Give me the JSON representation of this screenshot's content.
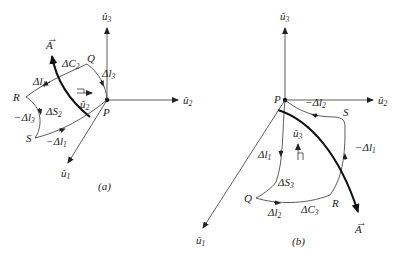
{
  "figure": {
    "panels": [
      {
        "id": "a",
        "caption": "(a)",
        "origin_label": "P",
        "axes": {
          "u1": "û1",
          "u2": "û2",
          "u3": "û3"
        },
        "vector_label": "A⃗",
        "curve_label": "ΔC2",
        "surface_label": "ΔS2",
        "normal_label": "û2",
        "corners": [
          "P",
          "Q",
          "R",
          "S"
        ],
        "segments": [
          "Δl⃗3",
          "Δl⃗1",
          "−Δl⃗3",
          "−Δl⃗1"
        ]
      },
      {
        "id": "b",
        "caption": "(b)",
        "origin_label": "P",
        "axes": {
          "u1": "û1",
          "u2": "û2",
          "u3": "û3"
        },
        "vector_label": "A⃗",
        "curve_label": "ΔC3",
        "surface_label": "ΔS3",
        "normal_label": "û3",
        "corners": [
          "P",
          "Q",
          "R",
          "S"
        ],
        "segments": [
          "Δl⃗1",
          "Δl⃗2",
          "−Δl⃗1",
          "−Δl⃗2"
        ]
      }
    ]
  },
  "labels": {
    "a": {
      "u3": "û",
      "u3s": "3",
      "u2": "û",
      "u2s": "2",
      "u1": "û",
      "u1s": "1",
      "A": "A",
      "Q": "Q",
      "R": "R",
      "S": "S",
      "P": "P",
      "dC": "ΔC",
      "dCs": "2",
      "dS": "ΔS",
      "dSs": "2",
      "dl3": "Δl",
      "dl3s": "3",
      "dl1": "Δl",
      "dl1s": "1",
      "mdl3": "−Δl",
      "mdl3s": "3",
      "mdl1": "−Δl",
      "mdl1s": "1",
      "n": "û",
      "ns": "2",
      "cap": "(a)"
    },
    "b": {
      "u3": "û",
      "u3s": "3",
      "u2": "û",
      "u2s": "2",
      "u1": "û",
      "u1s": "1",
      "A": "A",
      "Q": "Q",
      "R": "R",
      "S": "S",
      "P": "P",
      "dC": "ΔC",
      "dCs": "3",
      "dS": "ΔS",
      "dSs": "3",
      "dl1": "Δl",
      "dl1s": "1",
      "dl2": "Δl",
      "dl2s": "2",
      "mdl1": "−Δl",
      "mdl1s": "1",
      "mdl2": "−Δl",
      "mdl2s": "2",
      "n": "û",
      "ns": "3",
      "cap": "(b)"
    }
  }
}
